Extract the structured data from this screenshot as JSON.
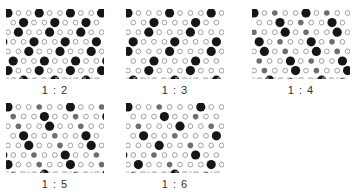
{
  "colors": {
    "large_dot": "#1a1414",
    "medium_dot": "#6e6e6e",
    "small_ring_stroke": "#8a8a8a",
    "background": "#ffffff",
    "dash": "#bbbbbb"
  },
  "panels": [
    {
      "label": "1 : 2",
      "ratio": [
        1,
        2
      ],
      "x": 6,
      "y": 9,
      "w": 98,
      "h": 70,
      "label_y": 84,
      "pattern": "1:2"
    },
    {
      "label": "1 : 3",
      "ratio": [
        1,
        3
      ],
      "x": 126,
      "y": 9,
      "w": 98,
      "h": 70,
      "label_y": 84,
      "pattern": "1:3"
    },
    {
      "label": "1 : 4",
      "ratio": [
        1,
        4
      ],
      "x": 252,
      "y": 9,
      "w": 98,
      "h": 70,
      "label_y": 84,
      "pattern": "1:4"
    },
    {
      "label": "1 : 5",
      "ratio": [
        1,
        5
      ],
      "x": 6,
      "y": 103,
      "w": 98,
      "h": 70,
      "label_y": 178,
      "pattern": "1:5"
    },
    {
      "label": "1 : 6",
      "ratio": [
        1,
        6
      ],
      "x": 126,
      "y": 103,
      "w": 98,
      "h": 70,
      "label_y": 178,
      "pattern": "1:6"
    }
  ],
  "dot_sizes": {
    "large_r": 4.6,
    "medium_r": 2.8,
    "small_r": 2.4
  }
}
